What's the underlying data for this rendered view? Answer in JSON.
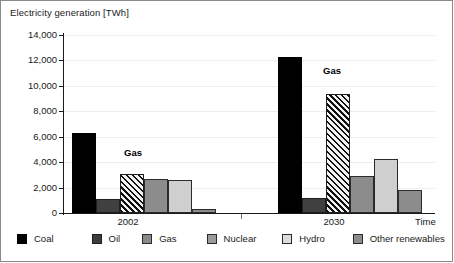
{
  "chart_data": {
    "type": "bar",
    "title": "",
    "ylabel": "Electricity generation [TWh]",
    "xlabel": "Time",
    "ylim": [
      0,
      14000
    ],
    "yticks": [
      "0",
      "2,000",
      "4,000",
      "6,000",
      "8,000",
      "10,000",
      "12,000",
      "14,000"
    ],
    "ytick_values": [
      0,
      2000,
      4000,
      6000,
      8000,
      10000,
      12000,
      14000
    ],
    "categories": [
      "2002",
      "2030"
    ],
    "grid": true,
    "legend_position": "bottom",
    "annotations": [
      {
        "text": "Gas",
        "group": "2002"
      },
      {
        "text": "Gas",
        "group": "2030"
      }
    ],
    "series": [
      {
        "name": "Coal",
        "values": [
          6300,
          12250
        ],
        "color": "#000000"
      },
      {
        "name": "Oil",
        "values": [
          1100,
          1150
        ],
        "color": "#404040"
      },
      {
        "name": "Gas",
        "values": [
          3050,
          9350
        ],
        "color": "#8a8a8a"
      },
      {
        "name": "Nuclear",
        "values": [
          2650,
          2900
        ],
        "color": "#8c8c8c"
      },
      {
        "name": "Hydro",
        "values": [
          2600,
          4250
        ],
        "color": "#cfcfcf"
      },
      {
        "name": "Other renewables",
        "values": [
          320,
          1800
        ],
        "color": "#8c8c8c"
      }
    ]
  },
  "legend": {
    "items": [
      {
        "label": "Coal"
      },
      {
        "label": "Oil"
      },
      {
        "label": "Gas"
      },
      {
        "label": "Nuclear"
      },
      {
        "label": "Hydro"
      },
      {
        "label": "Other renewables"
      }
    ]
  }
}
